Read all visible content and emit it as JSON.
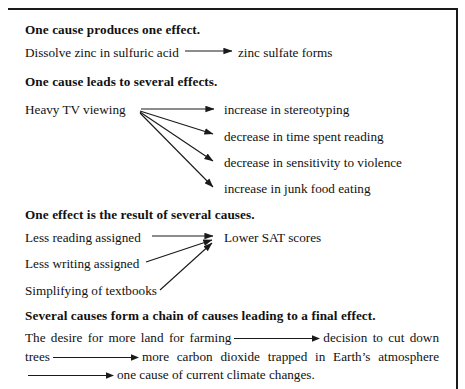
{
  "figure": {
    "background_color": "#ffffff",
    "ink_color": "#1a1a1a",
    "rule_color": "#1a1a1a"
  },
  "sections": [
    {
      "id": "one-to-one",
      "heading": "One cause produces one effect.",
      "cause": "Dissolve zinc in sulfuric acid",
      "effect": "zinc sulfate forms"
    },
    {
      "id": "one-to-many",
      "heading": "One cause leads to several effects.",
      "cause": "Heavy TV viewing",
      "effects": [
        "increase in stereotyping",
        "decrease in time spent reading",
        "decrease in sensitivity to violence",
        "increase in junk food eating"
      ]
    },
    {
      "id": "many-to-one",
      "heading": "One effect is the result of several causes.",
      "causes": [
        "Less reading assigned",
        "Less writing assigned",
        "Simplifying of textbooks"
      ],
      "effect": "Lower SAT scores"
    },
    {
      "id": "chain",
      "heading": "Several causes form a chain of causes leading to a final effect.",
      "links": [
        "The desire for more land for farming",
        "decision to cut down trees",
        "more carbon dioxide trapped in Earth’s atmosphere",
        "one cause of current climate changes."
      ]
    }
  ]
}
